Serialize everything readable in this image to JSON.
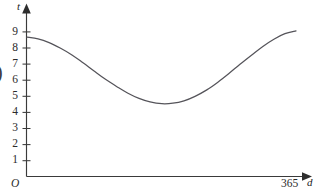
{
  "chart_data": {
    "type": "line",
    "title": "",
    "subtitle": "",
    "xlabel": "d",
    "ylabel": "t",
    "origin_label": "O",
    "x_tick_labels": [
      "365"
    ],
    "x_tick_values": [
      365
    ],
    "y_tick_labels": [
      "1",
      "2",
      "3",
      "4",
      "5",
      "6",
      "7",
      "8",
      "9"
    ],
    "y_tick_values": [
      1,
      2,
      3,
      4,
      5,
      6,
      7,
      8,
      9
    ],
    "xlim": [
      0,
      365
    ],
    "ylim": [
      0,
      9.8
    ],
    "grid": false,
    "legend": null,
    "legend_position": "none",
    "annotations": [],
    "axis_arrows": true,
    "series": [
      {
        "name": "daylight-hours",
        "x": [
          0,
          15,
          30,
          45,
          61,
          76,
          91,
          106,
          122,
          137,
          152,
          167,
          183,
          198,
          213,
          228,
          244,
          259,
          274,
          289,
          305,
          320,
          335,
          350,
          365
        ],
        "y": [
          8.65,
          8.55,
          8.32,
          7.98,
          7.55,
          7.06,
          6.55,
          6.05,
          5.58,
          5.17,
          4.85,
          4.63,
          4.52,
          4.55,
          4.7,
          4.98,
          5.38,
          5.86,
          6.4,
          6.97,
          7.55,
          8.08,
          8.53,
          8.87,
          9.05
        ]
      }
    ],
    "min_point": {
      "x": 183,
      "y": 4.52
    },
    "start_point": {
      "x": 0,
      "y": 8.65
    },
    "end_point": {
      "x": 365,
      "y": 9.05
    },
    "colors": {
      "curve": "#55545a",
      "axis": "#3a3a3a",
      "text": "#2b2b2b",
      "background": "#ffffff"
    }
  },
  "clipped_left_glyph": ")"
}
